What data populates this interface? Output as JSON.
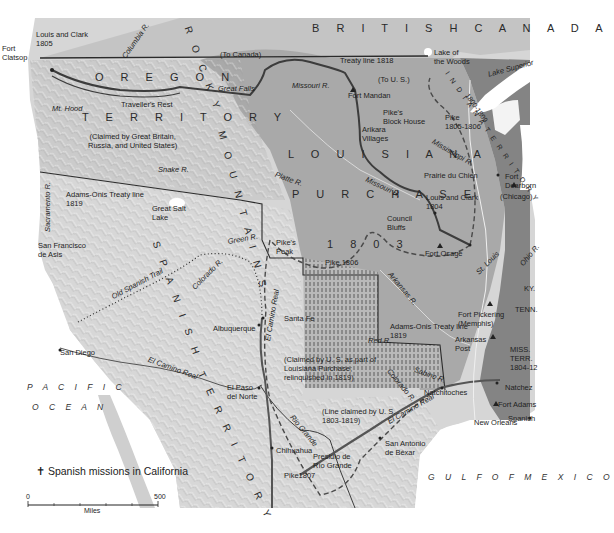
{
  "map": {
    "title_regions": {
      "british_canada": "B R I T I S H    C A N A D A",
      "oregon": "O R E G O N",
      "territory": "T E R R I T O R Y",
      "oregon_claim": "(Claimed by Great Britain,\nRussia, and United States)",
      "louisiana": "L O U I S I A N A",
      "purchase": "P U R C H A S E",
      "year": "1 8 0 3",
      "rocky": "R O C K Y",
      "mountains": "M O U N T A I N S",
      "spanish": "S P A N I S H",
      "territorio": "T E R R I T O R Y",
      "indiana": "I N D I A N A   T E R R I T O R Y",
      "indiana_years": "1800-1809",
      "pacific": "P A C I F I C",
      "ocean": "O C E A N",
      "gulf": "G U L F   O F   M E X I C O"
    },
    "places": [
      {
        "id": "fort-clatsop",
        "label": "Fort\nClatsop",
        "x": 2,
        "y": 44
      },
      {
        "id": "lewis-clark-1805",
        "label": "Louis and Clark\n1805",
        "x": 36,
        "y": 30
      },
      {
        "id": "mt-hood",
        "label": "Mt. Hood",
        "x": 52,
        "y": 104
      },
      {
        "id": "travellers-rest",
        "label": "Traveller's Rest",
        "x": 121,
        "y": 100
      },
      {
        "id": "great-falls",
        "label": "Great Falls",
        "x": 218,
        "y": 84
      },
      {
        "id": "missouri-r-north",
        "label": "Missouri R.",
        "x": 292,
        "y": 81
      },
      {
        "id": "to-canada",
        "label": "(To Canada)",
        "x": 220,
        "y": 50
      },
      {
        "id": "treaty-1818",
        "label": "Treaty line 1818",
        "x": 340,
        "y": 56
      },
      {
        "id": "to-us",
        "label": "(To U. S.)",
        "x": 378,
        "y": 75
      },
      {
        "id": "lake-of-woods",
        "label": "Lake of\nthe Woods",
        "x": 434,
        "y": 48
      },
      {
        "id": "lake-superior",
        "label": "Lake Superior",
        "x": 487,
        "y": 70
      },
      {
        "id": "fort-mandan",
        "label": "Fort Mandan",
        "x": 348,
        "y": 91
      },
      {
        "id": "pikes-block-house",
        "label": "Pike's\nBlock House",
        "x": 383,
        "y": 108
      },
      {
        "id": "pike-1805",
        "label": "Pike\n1805-1806",
        "x": 445,
        "y": 113
      },
      {
        "id": "arikara",
        "label": "Arikara\nVillages",
        "x": 362,
        "y": 125
      },
      {
        "id": "mississippi-r",
        "label": "Mississippi R.",
        "x": 435,
        "y": 137
      },
      {
        "id": "platte-r",
        "label": "Platte R.",
        "x": 277,
        "y": 170
      },
      {
        "id": "missouri-r-mid",
        "label": "Missouri R.",
        "x": 368,
        "y": 175
      },
      {
        "id": "prairie-du-chien",
        "label": "Prairie du Chien",
        "x": 424,
        "y": 171
      },
      {
        "id": "fort-dearborn",
        "label": "Fort\nDearborn",
        "x": 505,
        "y": 172
      },
      {
        "id": "chicago",
        "label": "(Chicago)",
        "x": 500,
        "y": 192
      },
      {
        "id": "lewis-clark-1804",
        "label": "Louis and Clark\n1804",
        "x": 426,
        "y": 193
      },
      {
        "id": "council-bluffs",
        "label": "Council\nBluffs",
        "x": 387,
        "y": 214
      },
      {
        "id": "pikes-peak",
        "label": "Pike's\nPeak",
        "x": 276,
        "y": 238
      },
      {
        "id": "pike-1806",
        "label": "Pike 1806",
        "x": 325,
        "y": 258
      },
      {
        "id": "fort-osage",
        "label": "Fort Osage",
        "x": 425,
        "y": 249
      },
      {
        "id": "st-louis",
        "label": "St. Louis",
        "x": 474,
        "y": 270
      },
      {
        "id": "ohio-r",
        "label": "Ohio R.",
        "x": 518,
        "y": 262
      },
      {
        "id": "ky",
        "label": "KY.",
        "x": 524,
        "y": 284
      },
      {
        "id": "arkansas-r",
        "label": "Arkansas R.",
        "x": 393,
        "y": 270
      },
      {
        "id": "tenn",
        "label": "TENN.",
        "x": 515,
        "y": 305
      },
      {
        "id": "fort-pickering",
        "label": "Fort Pickering\n(Memphis)",
        "x": 458,
        "y": 310
      },
      {
        "id": "adams-onis-east",
        "label": "Adams-Onis Treaty line\n1819",
        "x": 390,
        "y": 322
      },
      {
        "id": "arkansas-post",
        "label": "Arkansas\nPost",
        "x": 455,
        "y": 335
      },
      {
        "id": "red-r",
        "label": "Red R.",
        "x": 368,
        "y": 336
      },
      {
        "id": "miss-terr",
        "label": "MISS.\nTERR.\n1804-12",
        "x": 510,
        "y": 345
      },
      {
        "id": "natchez",
        "label": "Natchez",
        "x": 505,
        "y": 383
      },
      {
        "id": "fort-adams",
        "label": "Fort Adams",
        "x": 498,
        "y": 400
      },
      {
        "id": "spanish-fla",
        "label": "Spanish",
        "x": 508,
        "y": 414
      },
      {
        "id": "new-orleans",
        "label": "New Orleans",
        "x": 474,
        "y": 418
      },
      {
        "id": "natchitoches",
        "label": "Natchitoches",
        "x": 424,
        "y": 388
      },
      {
        "id": "sabine-r",
        "label": "Sabine R.",
        "x": 416,
        "y": 365
      },
      {
        "id": "colorado-r",
        "label": "Colorado R.",
        "x": 392,
        "y": 367
      },
      {
        "id": "el-camino-real-tx",
        "label": "El Camino Real",
        "x": 386,
        "y": 418
      },
      {
        "id": "claimed-us",
        "label": "(Claimed by U. S. as part of\nLouisiana Purchase;\nrelinquished in 1819)",
        "x": 284,
        "y": 355
      },
      {
        "id": "line-claimed",
        "label": "(Line claimed by U. S.\n1803-1819)",
        "x": 322,
        "y": 407
      },
      {
        "id": "san-antonio",
        "label": "San Antonio\nde Béxar",
        "x": 385,
        "y": 439
      },
      {
        "id": "presidio",
        "label": "Presidio de\nRío Grande",
        "x": 313,
        "y": 452
      },
      {
        "id": "rio-grande",
        "label": "Rio Grande",
        "x": 295,
        "y": 413
      },
      {
        "id": "pike-1807",
        "label": "Pike1807",
        "x": 284,
        "y": 471
      },
      {
        "id": "chihuahua",
        "label": "Chihuahua",
        "x": 276,
        "y": 446
      },
      {
        "id": "el-paso",
        "label": "El Paso\ndel Norte",
        "x": 227,
        "y": 383
      },
      {
        "id": "el-camino-real-nm",
        "label": "El Camino Real",
        "x": 263,
        "y": 340
      },
      {
        "id": "el-camino-real-ca",
        "label": "El Camino Real",
        "x": 150,
        "y": 355
      },
      {
        "id": "santa-fe",
        "label": "Santa Fe",
        "x": 284,
        "y": 314
      },
      {
        "id": "albuquerque",
        "label": "Albuquerque",
        "x": 213,
        "y": 324
      },
      {
        "id": "old-spanish-trail",
        "label": "Old Spanish Trail",
        "x": 110,
        "y": 293
      },
      {
        "id": "colorado-r-west",
        "label": "Colorado R.",
        "x": 190,
        "y": 285
      },
      {
        "id": "green-r",
        "label": "Green R.",
        "x": 227,
        "y": 237
      },
      {
        "id": "great-salt-lake",
        "label": "Great Salt\nLake",
        "x": 152,
        "y": 204
      },
      {
        "id": "adams-onis-west",
        "label": "Adams-Onis Treaty line\n1819",
        "x": 66,
        "y": 190
      },
      {
        "id": "snake-r",
        "label": "Snake R.",
        "x": 158,
        "y": 165
      },
      {
        "id": "columbia-r",
        "label": "Columbia R.",
        "x": 120,
        "y": 55
      },
      {
        "id": "sacramento-r",
        "label": "Sacramento R.",
        "x": 43,
        "y": 232
      },
      {
        "id": "san-francisco",
        "label": "San Francisco\nde Asis",
        "x": 38,
        "y": 241
      },
      {
        "id": "san-diego",
        "label": "San Diego",
        "x": 60,
        "y": 348
      }
    ],
    "legend": {
      "mission_symbol": "✝",
      "mission_label": "Spanish missions in California"
    },
    "scale": {
      "start": "0",
      "end": "500",
      "unit": "Miles"
    },
    "colors": {
      "ocean": "#ffffff",
      "land_light": "#d9d9d9",
      "oregon": "#c9c9c9",
      "spanish": "#d3d3d3",
      "louisiana": "#a8a8a8",
      "us_east": "#808080",
      "canada": "#c4c4c4",
      "route": "#3c3c3c",
      "border": "#2b2b2b"
    }
  }
}
